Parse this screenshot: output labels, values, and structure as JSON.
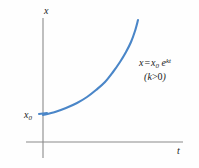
{
  "figure": {
    "background_color": "#fefefe",
    "axis_color": "#8a8a8a",
    "curve_color": "#4a86c8",
    "text_color": "#1a1a1a"
  },
  "axes": {
    "y_label": "x",
    "x_label": "t",
    "origin_label": "",
    "y_axis_top_px": 18,
    "y_axis_bottom_px": 158,
    "x_axis_left_px": 26,
    "x_axis_right_px": 183,
    "origin_x_px": 43,
    "origin_y_px": 142
  },
  "markers": {
    "x0": {
      "base": "x",
      "subscript": "0",
      "value_y_px": 115
    }
  },
  "annotation": {
    "equation": {
      "lhs": "x",
      "equals": "=",
      "rhs_base": "x",
      "rhs_sub": "0",
      "rhs_exp_base": "e",
      "rhs_exp_sup": "kt",
      "plain": "x = x0 e^{kt}"
    },
    "condition": {
      "open": "(",
      "symbol": "k",
      "operator": ">",
      "value": "0",
      "close": ")",
      "plain": "(k > 0)"
    }
  },
  "chart_data": {
    "type": "line",
    "title": "",
    "xlabel": "t",
    "ylabel": "x",
    "grid": false,
    "legend": null,
    "annotations": [
      "x = x0 e^{kt}",
      "(k > 0)"
    ],
    "series": [
      {
        "name": "x = x0 e^(kt)",
        "color": "#4a86c8",
        "function": "x0 * exp(k*t)",
        "x0": 1,
        "k_sign": "positive",
        "points_px": [
          [
            43,
            115
          ],
          [
            55,
            112
          ],
          [
            66,
            108
          ],
          [
            77,
            103
          ],
          [
            87,
            97
          ],
          [
            96,
            90
          ],
          [
            105,
            82
          ],
          [
            113,
            72
          ],
          [
            120,
            62
          ],
          [
            126,
            52
          ],
          [
            131,
            42
          ],
          [
            135,
            31
          ],
          [
            138,
            20
          ]
        ]
      }
    ],
    "xlim_px": [
      43,
      183
    ],
    "ylim_px": [
      142,
      18
    ]
  }
}
